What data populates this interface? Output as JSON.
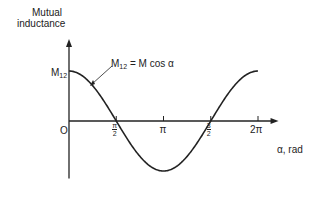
{
  "chart_data": {
    "type": "line",
    "title": "",
    "ylabel_line1": "Mutual",
    "ylabel_line2": "inductance",
    "xlabel": "α, rad",
    "y_max_label_main": "M",
    "y_max_label_sub": "12",
    "origin_label": "O",
    "annotation": {
      "lhs_main": "M",
      "lhs_sub": "12",
      "rhs": "= M cos α"
    },
    "xticks": [
      {
        "value": 1.5708,
        "label_num": "π",
        "label_den": "2"
      },
      {
        "value": 3.1416,
        "label": "π"
      },
      {
        "value": 4.7124,
        "label_num": "3",
        "label_den": "2"
      },
      {
        "value": 6.2832,
        "label": "2π"
      }
    ],
    "xlim": [
      0,
      6.9
    ],
    "ylim": [
      -1.15,
      1.6
    ],
    "series": [
      {
        "name": "M12 = M cos α",
        "function": "cos",
        "amplitude": 1,
        "x_range": [
          0,
          6.2832
        ]
      }
    ]
  }
}
